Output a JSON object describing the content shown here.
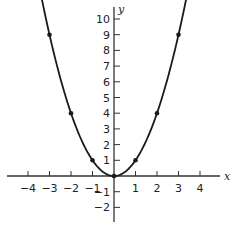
{
  "chart_data": {
    "type": "line",
    "title": "",
    "xlabel": "x",
    "ylabel": "y",
    "function": "y = x^2",
    "xlim": [
      -5,
      5
    ],
    "ylim": [
      -3,
      11
    ],
    "grid": false,
    "legend": null,
    "x_ticks": [
      -4,
      -3,
      -2,
      -1,
      1,
      2,
      3,
      4
    ],
    "x_tick_labels": [
      "−4",
      "−3",
      "−2",
      "−1",
      "1",
      "2",
      "3",
      "4"
    ],
    "y_ticks": [
      -2,
      -1,
      1,
      2,
      3,
      4,
      5,
      6,
      7,
      8,
      9,
      10
    ],
    "y_tick_labels": [
      "−2",
      "−1",
      "1",
      "2",
      "3",
      "4",
      "5",
      "6",
      "7",
      "8",
      "9",
      "10"
    ],
    "series": [
      {
        "name": "y = x^2",
        "curve_x_range": [
          -3.4,
          3.4
        ],
        "marked_points": [
          {
            "x": -3,
            "y": 9
          },
          {
            "x": -2,
            "y": 4
          },
          {
            "x": -1,
            "y": 1
          },
          {
            "x": 0,
            "y": 0
          },
          {
            "x": 1,
            "y": 1
          },
          {
            "x": 2,
            "y": 4
          },
          {
            "x": 3,
            "y": 9
          }
        ]
      }
    ]
  },
  "colors": {
    "line": "#1a1a1a",
    "axis": "#333333",
    "background": "#ffffff"
  }
}
